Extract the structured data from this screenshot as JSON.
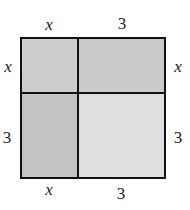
{
  "diagram": {
    "type": "area-model",
    "top_labels": [
      "x",
      "3"
    ],
    "bottom_labels": [
      "x",
      "3"
    ],
    "left_labels": [
      "x",
      "3"
    ],
    "right_labels": [
      "x",
      "3"
    ],
    "cells": [
      {
        "id": "top-left",
        "dims": "x by x",
        "color": "#cdcdcd"
      },
      {
        "id": "top-right",
        "dims": "3 by x",
        "color": "#cbcbcb"
      },
      {
        "id": "bottom-left",
        "dims": "x by 3",
        "color": "#c3c3c3"
      },
      {
        "id": "bottom-right",
        "dims": "3 by 3",
        "color": "#dfdfdf"
      }
    ],
    "line_color": "#111111"
  }
}
